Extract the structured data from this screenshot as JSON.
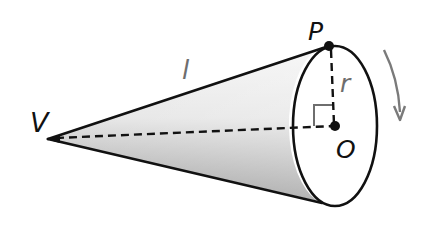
{
  "diagram": {
    "labels": {
      "vertex": "V",
      "rim_point": "P",
      "center": "O",
      "slant_height": "l",
      "radius": "r"
    },
    "colors": {
      "stroke": "#111111",
      "label_dark": "#111111",
      "label_gray": "#6e6e6e",
      "arrow": "#7a7a7a",
      "shade_dark": "#9a9a9a",
      "shade_light": "#f2f2f2",
      "background": "#ffffff"
    },
    "elements": [
      "cone lateral surface (shaded)",
      "circular base (ellipse)",
      "slant height VP",
      "axis VO (dashed)",
      "radius OP (dashed)",
      "right-angle marker at O",
      "rotation arrow"
    ]
  }
}
